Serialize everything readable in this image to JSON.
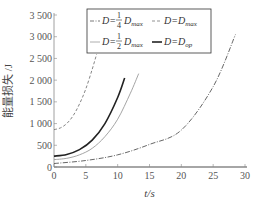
{
  "chart_data": {
    "type": "line",
    "title": "",
    "xlabel": "t/s",
    "ylabel": "能量损失 /J",
    "xlim": [
      0,
      30
    ],
    "ylim": [
      0,
      3500
    ],
    "xticks": [
      0,
      5,
      10,
      15,
      20,
      25,
      30
    ],
    "yticks": [
      0,
      500,
      1000,
      1500,
      2000,
      2500,
      3000,
      3500
    ],
    "ytick_labels": [
      "0",
      "500",
      "1 000",
      "1 500",
      "2 000",
      "2 500",
      "3 000",
      "3 500"
    ],
    "grid": false,
    "legend_position": "upper center (boxed)",
    "series": [
      {
        "name": "D=1/4 D_max",
        "style": "dash-dot",
        "color": "#555555",
        "x": [
          0,
          5,
          10,
          15,
          20,
          25,
          28.5
        ],
        "y": [
          80,
          150,
          280,
          520,
          850,
          1850,
          3050
        ]
      },
      {
        "name": "D=D_max",
        "style": "dashed",
        "color": "#777777",
        "x": [
          0,
          1,
          2,
          3,
          4,
          5,
          6,
          6.7
        ],
        "y": [
          860,
          900,
          1000,
          1180,
          1450,
          1800,
          2250,
          2600
        ]
      },
      {
        "name": "D=1/2 D_max",
        "style": "solid-thin",
        "color": "#9a9a9a",
        "x": [
          0,
          2,
          4,
          6,
          8,
          10,
          12,
          13.3
        ],
        "y": [
          170,
          200,
          280,
          430,
          700,
          1100,
          1700,
          2150
        ]
      },
      {
        "name": "D=D_op",
        "style": "solid-thick",
        "color": "#222222",
        "x": [
          0,
          2,
          4,
          6,
          8,
          10,
          11.1
        ],
        "y": [
          250,
          290,
          400,
          620,
          1000,
          1600,
          2050
        ]
      }
    ]
  },
  "legend": {
    "items": [
      {
        "pre": "D=",
        "frac": "1/4",
        "num": "1",
        "den": "4",
        "post": "D",
        "sub": "max"
      },
      {
        "pre": "D=D",
        "sub": "max"
      },
      {
        "pre": "D=",
        "frac": "1/2",
        "num": "1",
        "den": "2",
        "post": "D",
        "sub": "max"
      },
      {
        "pre": "D=D",
        "sub": "op"
      }
    ]
  }
}
